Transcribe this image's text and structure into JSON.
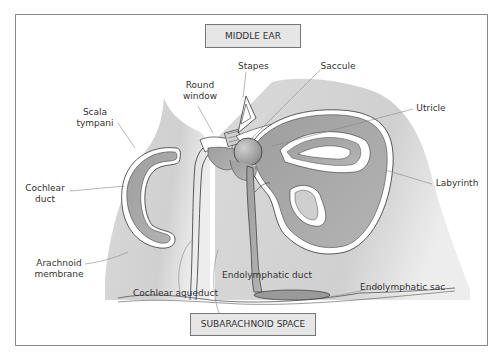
{
  "diagram": {
    "regions": {
      "top_box": "MIDDLE EAR",
      "bottom_box": "SUBARACHNOID SPACE"
    },
    "labels": [
      {
        "id": "round-window",
        "line1": "Round",
        "line2": "window"
      },
      {
        "id": "stapes",
        "line1": "Stapes"
      },
      {
        "id": "saccule",
        "line1": "Saccule"
      },
      {
        "id": "scala-tympani",
        "line1": "Scala",
        "line2": "tympani"
      },
      {
        "id": "utricle",
        "line1": "Utricle"
      },
      {
        "id": "cochlear-duct",
        "line1": "Cochlear",
        "line2": "duct"
      },
      {
        "id": "labyrinth",
        "line1": "Labyrinth"
      },
      {
        "id": "arachnoid-membrane",
        "line1": "Arachnoid",
        "line2": "membrane"
      },
      {
        "id": "endolymphatic-duct",
        "line1": "Endolymphatic duct"
      },
      {
        "id": "endolymphatic-sac",
        "line1": "Endolymphatic sac"
      },
      {
        "id": "cochlear-aqueduct",
        "line1": "Cochlear aqueduct"
      }
    ],
    "colors": {
      "frame": "#8a8a8a",
      "bone": "#d4d4d4",
      "membranous": "#a9a9a9",
      "box_fill": "#e6e6e6",
      "leader": "#888888"
    }
  }
}
